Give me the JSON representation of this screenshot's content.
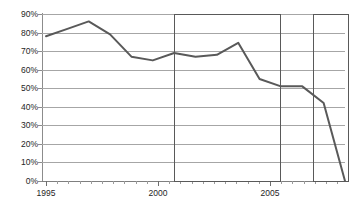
{
  "chart_data": {
    "type": "line",
    "title": "",
    "subtitle": "",
    "xlabel": "",
    "ylabel": "",
    "xlim": [
      1994.5,
      2009.5
    ],
    "ylim": [
      0,
      90
    ],
    "grid": true,
    "legend": false,
    "legend_position": "none",
    "x_tick_labels": [
      "1995",
      "2000",
      "2005"
    ],
    "x_tick_values": [
      1995,
      2000,
      2005
    ],
    "y_tick_labels": [
      "0%",
      "10%",
      "20%",
      "30%",
      "40%",
      "50%",
      "60%",
      "70%",
      "80%",
      "90%"
    ],
    "y_tick_values": [
      0,
      10,
      20,
      30,
      40,
      50,
      60,
      70,
      80,
      90
    ],
    "y_unit": "%",
    "x": [
      1995,
      1996,
      1997,
      1998,
      1999,
      2000,
      2001,
      2002,
      2003,
      2004,
      2005,
      2006,
      2007,
      2008,
      2009
    ],
    "values": [
      78,
      82,
      86,
      79,
      67,
      65,
      69,
      67,
      68,
      74.5,
      55,
      51,
      51,
      42,
      0
    ],
    "series": [
      {
        "name": "series-1",
        "color": "#595959",
        "line_width": 2,
        "values": [
          78,
          82,
          86,
          79,
          67,
          65,
          69,
          67,
          68,
          74.5,
          55,
          51,
          51,
          42,
          0
        ]
      }
    ],
    "annotations": [
      {
        "name": "highlight-box-1",
        "type": "rect",
        "x_start": 2001,
        "x_end": 2006,
        "y_start": 0,
        "y_end": 90,
        "border_color": "#595959"
      },
      {
        "name": "highlight-box-2",
        "type": "rect",
        "x_start": 2007.5,
        "x_end": 2009.2,
        "y_start": 0,
        "y_end": 90,
        "border_color": "#595959"
      }
    ],
    "colors": {
      "line": "#595959",
      "gridline": "#a6a6a6",
      "axis": "#8c8c8c",
      "text": "#262626",
      "background": "#ffffff"
    }
  }
}
